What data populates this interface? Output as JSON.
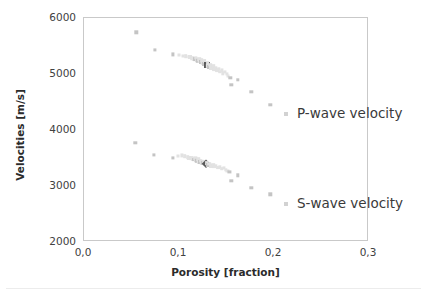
{
  "chart_data": {
    "type": "scatter",
    "title": "",
    "xlabel": "Porosity [fraction]",
    "ylabel": "Velocities [m/s]",
    "xlim": [
      0.0,
      0.3
    ],
    "ylim": [
      2000,
      6000
    ],
    "xticks": [
      "0,0",
      "0,1",
      "0,2",
      "0,3"
    ],
    "xtick_values": [
      0.0,
      0.1,
      0.2,
      0.3
    ],
    "yticks": [
      "2000",
      "3000",
      "4000",
      "5000",
      "6000"
    ],
    "ytick_values": [
      2000,
      3000,
      4000,
      5000,
      6000
    ],
    "grid": false,
    "legend_position": "inside-right",
    "marker_color_light": "#e2e2e2",
    "marker_color_mid": "#c4c4c4",
    "marker_color_dark": "#5a5a5a",
    "frame_color": "#c9c9c9",
    "series": [
      {
        "name": "P-wave velocity",
        "marker": "square",
        "points": [
          {
            "x": 0.055,
            "y": 5745,
            "shade": "mid",
            "size": 3.4
          },
          {
            "x": 0.075,
            "y": 5425,
            "shade": "mid",
            "size": 3.2
          },
          {
            "x": 0.094,
            "y": 5350,
            "shade": "mid",
            "size": 3.2
          },
          {
            "x": 0.1,
            "y": 5345,
            "shade": "light",
            "size": 3.0
          },
          {
            "x": 0.104,
            "y": 5330,
            "shade": "light",
            "size": 3.0
          },
          {
            "x": 0.107,
            "y": 5320,
            "shade": "light",
            "size": 3.6
          },
          {
            "x": 0.11,
            "y": 5305,
            "shade": "light",
            "size": 3.4
          },
          {
            "x": 0.112,
            "y": 5300,
            "shade": "light",
            "size": 4.0
          },
          {
            "x": 0.114,
            "y": 5285,
            "shade": "light",
            "size": 3.6
          },
          {
            "x": 0.116,
            "y": 5275,
            "shade": "light",
            "size": 4.2
          },
          {
            "x": 0.117,
            "y": 5265,
            "shade": "mid",
            "size": 3.8
          },
          {
            "x": 0.118,
            "y": 5290,
            "shade": "light",
            "size": 3.4
          },
          {
            "x": 0.119,
            "y": 5250,
            "shade": "light",
            "size": 4.0
          },
          {
            "x": 0.12,
            "y": 5240,
            "shade": "mid",
            "size": 4.4
          },
          {
            "x": 0.121,
            "y": 5265,
            "shade": "light",
            "size": 3.6
          },
          {
            "x": 0.122,
            "y": 5230,
            "shade": "light",
            "size": 4.2
          },
          {
            "x": 0.123,
            "y": 5215,
            "shade": "mid",
            "size": 4.0
          },
          {
            "x": 0.124,
            "y": 5245,
            "shade": "light",
            "size": 3.6
          },
          {
            "x": 0.125,
            "y": 5200,
            "shade": "light",
            "size": 4.4
          },
          {
            "x": 0.126,
            "y": 5185,
            "shade": "mid",
            "size": 4.0
          },
          {
            "x": 0.127,
            "y": 5225,
            "shade": "light",
            "size": 3.8
          },
          {
            "x": 0.128,
            "y": 5170,
            "shade": "light",
            "size": 4.2
          },
          {
            "x": 0.129,
            "y": 5155,
            "shade": "dark",
            "size": 6.0
          },
          {
            "x": 0.13,
            "y": 5195,
            "shade": "light",
            "size": 3.8
          },
          {
            "x": 0.131,
            "y": 5140,
            "shade": "light",
            "size": 4.2
          },
          {
            "x": 0.132,
            "y": 5125,
            "shade": "mid",
            "size": 4.0
          },
          {
            "x": 0.133,
            "y": 5165,
            "shade": "light",
            "size": 3.6
          },
          {
            "x": 0.134,
            "y": 5110,
            "shade": "light",
            "size": 4.0
          },
          {
            "x": 0.136,
            "y": 5140,
            "shade": "light",
            "size": 3.6
          },
          {
            "x": 0.137,
            "y": 5090,
            "shade": "light",
            "size": 3.8
          },
          {
            "x": 0.139,
            "y": 5115,
            "shade": "light",
            "size": 3.4
          },
          {
            "x": 0.14,
            "y": 5065,
            "shade": "light",
            "size": 3.8
          },
          {
            "x": 0.142,
            "y": 5090,
            "shade": "light",
            "size": 3.4
          },
          {
            "x": 0.143,
            "y": 5040,
            "shade": "light",
            "size": 3.6
          },
          {
            "x": 0.145,
            "y": 5065,
            "shade": "light",
            "size": 3.2
          },
          {
            "x": 0.146,
            "y": 5015,
            "shade": "light",
            "size": 3.4
          },
          {
            "x": 0.148,
            "y": 5035,
            "shade": "light",
            "size": 3.2
          },
          {
            "x": 0.15,
            "y": 4995,
            "shade": "light",
            "size": 3.2
          },
          {
            "x": 0.152,
            "y": 4960,
            "shade": "light",
            "size": 3.0
          },
          {
            "x": 0.154,
            "y": 4930,
            "shade": "mid",
            "size": 3.4
          },
          {
            "x": 0.155,
            "y": 4810,
            "shade": "mid",
            "size": 3.4
          },
          {
            "x": 0.162,
            "y": 4895,
            "shade": "mid",
            "size": 3.4
          },
          {
            "x": 0.176,
            "y": 4685,
            "shade": "mid",
            "size": 3.4
          },
          {
            "x": 0.196,
            "y": 4455,
            "shade": "mid",
            "size": 3.4
          }
        ]
      },
      {
        "name": "S-wave velocity",
        "marker": "diamond",
        "points": [
          {
            "x": 0.054,
            "y": 3775,
            "shade": "mid",
            "size": 3.4
          },
          {
            "x": 0.074,
            "y": 3555,
            "shade": "mid",
            "size": 3.2
          },
          {
            "x": 0.094,
            "y": 3495,
            "shade": "mid",
            "size": 3.2
          },
          {
            "x": 0.099,
            "y": 3530,
            "shade": "light",
            "size": 3.0
          },
          {
            "x": 0.103,
            "y": 3545,
            "shade": "light",
            "size": 3.2
          },
          {
            "x": 0.106,
            "y": 3530,
            "shade": "light",
            "size": 3.6
          },
          {
            "x": 0.109,
            "y": 3515,
            "shade": "light",
            "size": 3.6
          },
          {
            "x": 0.111,
            "y": 3505,
            "shade": "light",
            "size": 4.0
          },
          {
            "x": 0.113,
            "y": 3495,
            "shade": "light",
            "size": 3.8
          },
          {
            "x": 0.115,
            "y": 3485,
            "shade": "light",
            "size": 4.2
          },
          {
            "x": 0.116,
            "y": 3470,
            "shade": "mid",
            "size": 3.8
          },
          {
            "x": 0.117,
            "y": 3495,
            "shade": "light",
            "size": 3.4
          },
          {
            "x": 0.118,
            "y": 3460,
            "shade": "light",
            "size": 4.0
          },
          {
            "x": 0.119,
            "y": 3450,
            "shade": "mid",
            "size": 4.4
          },
          {
            "x": 0.12,
            "y": 3475,
            "shade": "light",
            "size": 3.6
          },
          {
            "x": 0.121,
            "y": 3440,
            "shade": "light",
            "size": 4.2
          },
          {
            "x": 0.122,
            "y": 3430,
            "shade": "mid",
            "size": 4.0
          },
          {
            "x": 0.123,
            "y": 3455,
            "shade": "light",
            "size": 3.6
          },
          {
            "x": 0.124,
            "y": 3420,
            "shade": "light",
            "size": 4.4
          },
          {
            "x": 0.125,
            "y": 3410,
            "shade": "mid",
            "size": 4.2
          },
          {
            "x": 0.126,
            "y": 3435,
            "shade": "light",
            "size": 3.8
          },
          {
            "x": 0.127,
            "y": 3400,
            "shade": "light",
            "size": 4.2
          },
          {
            "x": 0.128,
            "y": 3390,
            "shade": "dark",
            "size": 6.2
          },
          {
            "x": 0.129,
            "y": 3415,
            "shade": "light",
            "size": 3.8
          },
          {
            "x": 0.13,
            "y": 3380,
            "shade": "light",
            "size": 4.2
          },
          {
            "x": 0.131,
            "y": 3370,
            "shade": "mid",
            "size": 4.0
          },
          {
            "x": 0.132,
            "y": 3395,
            "shade": "light",
            "size": 3.6
          },
          {
            "x": 0.134,
            "y": 3360,
            "shade": "light",
            "size": 4.0
          },
          {
            "x": 0.136,
            "y": 3380,
            "shade": "light",
            "size": 3.6
          },
          {
            "x": 0.137,
            "y": 3345,
            "shade": "light",
            "size": 3.8
          },
          {
            "x": 0.139,
            "y": 3365,
            "shade": "light",
            "size": 3.4
          },
          {
            "x": 0.141,
            "y": 3330,
            "shade": "light",
            "size": 3.8
          },
          {
            "x": 0.143,
            "y": 3345,
            "shade": "light",
            "size": 3.4
          },
          {
            "x": 0.145,
            "y": 3310,
            "shade": "light",
            "size": 3.6
          },
          {
            "x": 0.147,
            "y": 3325,
            "shade": "light",
            "size": 3.2
          },
          {
            "x": 0.149,
            "y": 3290,
            "shade": "light",
            "size": 3.4
          },
          {
            "x": 0.151,
            "y": 3270,
            "shade": "light",
            "size": 3.2
          },
          {
            "x": 0.153,
            "y": 3250,
            "shade": "mid",
            "size": 3.2
          },
          {
            "x": 0.155,
            "y": 3095,
            "shade": "mid",
            "size": 3.4
          },
          {
            "x": 0.162,
            "y": 3190,
            "shade": "mid",
            "size": 3.4
          },
          {
            "x": 0.176,
            "y": 2965,
            "shade": "mid",
            "size": 3.4
          },
          {
            "x": 0.196,
            "y": 2855,
            "shade": "mid",
            "size": 3.4
          }
        ]
      }
    ]
  },
  "legend": {
    "p_wave": "P-wave velocity",
    "s_wave": "S-wave velocity"
  },
  "axes": {
    "ylabel": "Velocities [m/s]",
    "xlabel": "Porosity [fraction]"
  }
}
